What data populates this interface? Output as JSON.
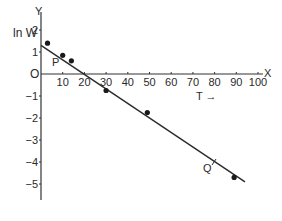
{
  "chart_data": {
    "type": "scatter",
    "title": "",
    "xlabel": "T →",
    "ylabel": "ln W",
    "x_axis_letter": "X",
    "y_axis_letter": "Y",
    "origin_label": "O",
    "xlim": [
      0,
      100
    ],
    "ylim": [
      -5.5,
      2.5
    ],
    "grid": false,
    "legend": null,
    "x_ticks": [
      10,
      20,
      30,
      40,
      50,
      60,
      70,
      80,
      90,
      100
    ],
    "x_tick_labels": [
      "10",
      "20",
      "30",
      "40",
      "50",
      "60",
      "70",
      "80",
      "90",
      "100"
    ],
    "y_ticks": [
      2,
      1,
      -1,
      -2,
      -3,
      -4,
      -5
    ],
    "y_tick_labels": [
      "2",
      "1",
      "−1",
      "−2",
      "−3",
      "−4",
      "−5"
    ],
    "series": [
      {
        "name": "measured points",
        "kind": "scatter",
        "x": [
          3,
          10,
          14,
          30,
          49,
          89
        ],
        "y": [
          1.4,
          0.85,
          0.6,
          -0.75,
          -1.75,
          -4.7
        ]
      },
      {
        "name": "best-fit line",
        "kind": "line",
        "x": [
          0,
          94
        ],
        "y": [
          1.3,
          -4.9
        ]
      }
    ],
    "annotations": [
      {
        "text": "P",
        "x": 7,
        "y": 0.55,
        "note": "point on line"
      },
      {
        "text": "Q",
        "x": 77,
        "y": -4.35,
        "note": "point on line, tick mark at T=80"
      }
    ]
  },
  "labels": {
    "y_letter": "Y",
    "x_letter": "X",
    "ylabel": "ln W",
    "xlabel": "T →",
    "origin": "O",
    "p": "P",
    "q": "Q"
  }
}
